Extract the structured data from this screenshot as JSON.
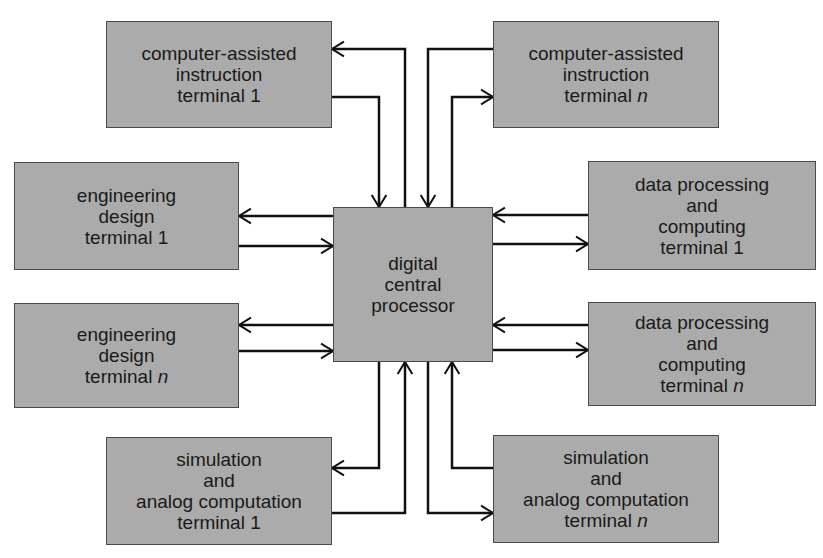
{
  "diagram": {
    "central": {
      "id": "processor",
      "lines": [
        "digital",
        "central",
        "processor"
      ],
      "rect": {
        "x": 333,
        "y": 207,
        "w": 160,
        "h": 155
      }
    },
    "terminals": [
      {
        "id": "cai-1",
        "lines": [
          "computer-assisted",
          "instruction",
          "terminal 1"
        ],
        "rect": {
          "x": 106,
          "y": 21,
          "w": 226,
          "h": 107
        }
      },
      {
        "id": "cai-n",
        "lines": [
          "computer-assisted",
          "instruction",
          "terminal"
        ],
        "suffix": "n",
        "rect": {
          "x": 493,
          "y": 21,
          "w": 226,
          "h": 107
        }
      },
      {
        "id": "eng-1",
        "lines": [
          "engineering",
          "design",
          "terminal 1"
        ],
        "rect": {
          "x": 14,
          "y": 162,
          "w": 225,
          "h": 108
        }
      },
      {
        "id": "eng-n",
        "lines": [
          "engineering",
          "design",
          "terminal"
        ],
        "suffix": "n",
        "rect": {
          "x": 14,
          "y": 303,
          "w": 225,
          "h": 105
        }
      },
      {
        "id": "dp-1",
        "lines": [
          "data processing",
          "and",
          "computing",
          "terminal 1"
        ],
        "rect": {
          "x": 588,
          "y": 161,
          "w": 228,
          "h": 109
        }
      },
      {
        "id": "dp-n",
        "lines": [
          "data processing",
          "and",
          "computing",
          "terminal"
        ],
        "suffix": "n",
        "rect": {
          "x": 588,
          "y": 302,
          "w": 228,
          "h": 104
        }
      },
      {
        "id": "sim-1",
        "lines": [
          "simulation",
          "and",
          "analog computation",
          "terminal 1"
        ],
        "rect": {
          "x": 106,
          "y": 437,
          "w": 226,
          "h": 108
        }
      },
      {
        "id": "sim-n",
        "lines": [
          "simulation",
          "and",
          "analog computation",
          "terminal"
        ],
        "suffix": "n",
        "rect": {
          "x": 493,
          "y": 435,
          "w": 226,
          "h": 108
        }
      }
    ],
    "connections": [
      {
        "from": "processor",
        "to": "cai-1",
        "path": [
          [
            405,
            207
          ],
          [
            405,
            49
          ],
          [
            332,
            49
          ]
        ]
      },
      {
        "from": "cai-1",
        "to": "processor",
        "path": [
          [
            332,
            97
          ],
          [
            379,
            97
          ],
          [
            379,
            207
          ]
        ]
      },
      {
        "from": "cai-n",
        "to": "processor",
        "path": [
          [
            493,
            49
          ],
          [
            428,
            49
          ],
          [
            428,
            207
          ]
        ]
      },
      {
        "from": "processor",
        "to": "cai-n",
        "path": [
          [
            452,
            207
          ],
          [
            452,
            97
          ],
          [
            493,
            97
          ]
        ]
      },
      {
        "from": "processor",
        "to": "eng-1",
        "path": [
          [
            333,
            216
          ],
          [
            239,
            216
          ]
        ]
      },
      {
        "from": "eng-1",
        "to": "processor",
        "path": [
          [
            239,
            246
          ],
          [
            333,
            246
          ]
        ]
      },
      {
        "from": "processor",
        "to": "eng-n",
        "path": [
          [
            333,
            325
          ],
          [
            239,
            325
          ]
        ]
      },
      {
        "from": "eng-n",
        "to": "processor",
        "path": [
          [
            239,
            351
          ],
          [
            333,
            351
          ]
        ]
      },
      {
        "from": "dp-1",
        "to": "processor",
        "path": [
          [
            588,
            215
          ],
          [
            493,
            215
          ]
        ]
      },
      {
        "from": "processor",
        "to": "dp-1",
        "path": [
          [
            493,
            244
          ],
          [
            588,
            244
          ]
        ]
      },
      {
        "from": "dp-n",
        "to": "processor",
        "path": [
          [
            588,
            325
          ],
          [
            493,
            325
          ]
        ]
      },
      {
        "from": "processor",
        "to": "dp-n",
        "path": [
          [
            493,
            350
          ],
          [
            588,
            350
          ]
        ]
      },
      {
        "from": "processor",
        "to": "sim-1",
        "path": [
          [
            379,
            362
          ],
          [
            379,
            468
          ],
          [
            332,
            468
          ]
        ]
      },
      {
        "from": "sim-1",
        "to": "processor",
        "path": [
          [
            332,
            513
          ],
          [
            405,
            513
          ],
          [
            405,
            362
          ]
        ]
      },
      {
        "from": "sim-n",
        "to": "processor",
        "path": [
          [
            493,
            468
          ],
          [
            452,
            468
          ],
          [
            452,
            362
          ]
        ]
      },
      {
        "from": "processor",
        "to": "sim-n",
        "path": [
          [
            428,
            362
          ],
          [
            428,
            513
          ],
          [
            493,
            513
          ]
        ]
      }
    ],
    "colors": {
      "box_fill": "#ababab",
      "box_border": "#4a4a4a",
      "line": "#111111",
      "text": "#1a1a1a"
    }
  }
}
